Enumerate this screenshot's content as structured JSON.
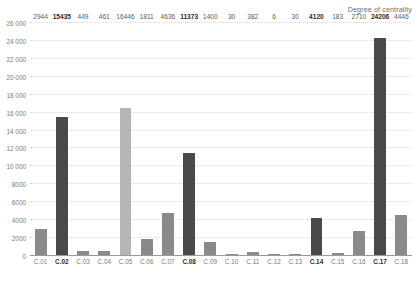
{
  "chart_data": {
    "type": "bar",
    "title": "Degree of centrality",
    "xlabel": "",
    "ylabel": "",
    "ylim": [
      0,
      26000
    ],
    "ytick_step": 2000,
    "grid": true,
    "legend": null,
    "categories": [
      "C.01",
      "C.02",
      "C.03",
      "C.04",
      "C.05",
      "C.06",
      "C.07",
      "C.08",
      "C.09",
      "C.10",
      "C.11",
      "C.12",
      "C.13",
      "C.14",
      "C.15",
      "C.16",
      "C.17",
      "C.18"
    ],
    "values": [
      2944,
      15435,
      449,
      461,
      16446,
      1811,
      4636,
      11373,
      1400,
      30,
      382,
      6,
      30,
      4120,
      183,
      2710,
      24206,
      4446
    ],
    "value_labels": [
      "2944",
      "15435",
      "449",
      "461",
      "16446",
      "1811",
      "4636",
      "11373",
      "1400",
      "30",
      "382",
      "6",
      "30",
      "4120",
      "183",
      "2710",
      "24206",
      "4446"
    ],
    "bar_shades": [
      "mid",
      "dark",
      "mid",
      "mid",
      "light",
      "mid",
      "mid",
      "dark",
      "mid",
      "mid",
      "mid",
      "mid",
      "mid",
      "dark",
      "mid",
      "mid",
      "dark",
      "mid"
    ],
    "emphasized": [
      false,
      true,
      false,
      false,
      false,
      false,
      false,
      true,
      false,
      false,
      false,
      false,
      false,
      true,
      false,
      false,
      true,
      false
    ],
    "ytick_labels": [
      "0",
      "2000",
      "4000",
      "6000",
      "8000",
      "10 000",
      "12 000",
      "14 000",
      "16 000",
      "18 000",
      "20 000",
      "22 000",
      "24 000",
      "26 000"
    ],
    "ytick_values": [
      0,
      2000,
      4000,
      6000,
      8000,
      10000,
      12000,
      14000,
      16000,
      18000,
      20000,
      22000,
      24000,
      26000
    ],
    "colors": {
      "bar_dark": "#4a4a4a",
      "bar_mid": "#8a8a8a",
      "bar_light": "#b5b5b5",
      "gridline": "#d9d9d9",
      "axis": "#9a9a9a",
      "tick_text": "#7a7a7a",
      "value_text": "#5a5a5a",
      "emph_text": "#2b2b2b",
      "title_text": "#6d6d6d",
      "background": "#ffffff"
    }
  }
}
